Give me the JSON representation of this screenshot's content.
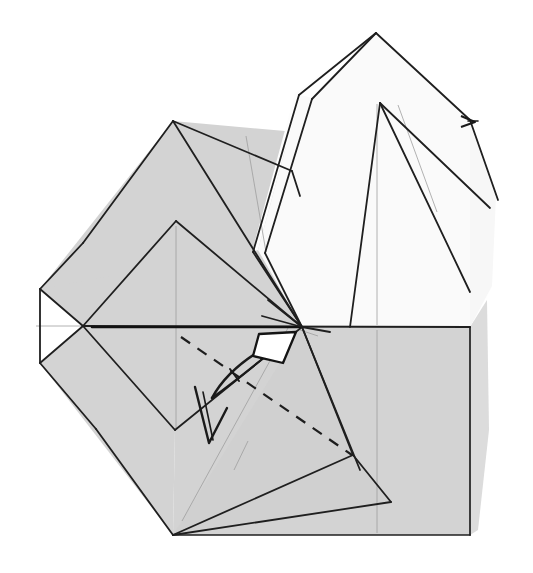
{
  "figure": {
    "kind": "origami-folding-diagram",
    "title": "",
    "caption": "",
    "step_number": "",
    "background_color": "#ffffff"
  },
  "palette": {
    "paper_front_gray": "#d2d2d2",
    "paper_front_gray_light": "#dcdcdc",
    "paper_back_white": "#f4f4f4",
    "paper_white": "#fbfbfb",
    "line_dark": "#1a1a1a",
    "line_mid": "#3a3a3a",
    "line_light": "#9a9a9a",
    "arrow_fill": "#ffffff",
    "arrow_stroke": "#141414"
  },
  "strokes": {
    "edge_width": 2.0,
    "fold_width": 1.5,
    "crease_width": 0.7,
    "dash_width": 2.2,
    "dash_pattern": "11 9"
  },
  "shapes": {
    "body_gray_left": {
      "name": "left-body-panel",
      "fill": "#d2d2d2",
      "points": "173,121 302,327 175,430 83,326 40,363 40,289 83,326"
    },
    "body_gray_upper_left": {
      "name": "upper-left-panel",
      "fill": "#d2d2d2",
      "points": "173,121 283,131 302,327 176,221 175,220"
    },
    "body_gray_lower": {
      "name": "lower-body-panel",
      "fill": "#d2d2d2",
      "points": "83,326 175,430 173,535 470,535 470,327 302,327"
    },
    "white_flap_upper": {
      "name": "upper-white-flap",
      "fill": "#fbfbfb",
      "points": "376,33 470,120 470,327 302,327 258,248 300,95 313,98"
    },
    "white_tail_right": {
      "name": "right-white-tail",
      "fill": "#fbfbfb",
      "points": "470,120 497,200 490,300 470,327"
    },
    "inner_flap": {
      "name": "inner-left-flap",
      "fill": "#d2d2d2",
      "points": "176,221 302,327 175,430 83,326"
    },
    "bottom_triangle": {
      "name": "bottom-right-triangle",
      "fill": "#d2d2d2",
      "points": "302,327 353,455 391,502 173,535"
    }
  },
  "lines": {
    "horizontal_center": {
      "name": "center-horizontal-fold",
      "x1": 40,
      "y1": 326,
      "x2": 470,
      "y2": 327
    },
    "right_vertical": {
      "name": "right-vertical-edge",
      "x1": 470,
      "y1": 327,
      "x2": 470,
      "y2": 535
    },
    "bottom_edge": {
      "name": "bottom-edge",
      "x1": 173,
      "y1": 535,
      "x2": 470,
      "y2": 535
    },
    "dashed_fold": {
      "name": "dashed-valley-fold",
      "x1": 186,
      "y1": 338,
      "x2": 352,
      "y2": 455
    }
  },
  "arrows": {
    "fold_arrow": {
      "name": "fold-arrow",
      "description": "hollow arrowhead pointing up-right",
      "tip_x": 297,
      "tip_y": 333,
      "head_points": "255,357 262,334 297,333 286,362",
      "shaft": "M 214,396 Q 232,376 262,352"
    },
    "repeat_mark": {
      "name": "repeat-v-mark",
      "description": "small v-shaped repeat symbol",
      "path": "M 196,389 L 209,443 L 225,410"
    },
    "edge_arrow_right": {
      "name": "right-edge-arrow",
      "description": "small arrowhead near right edge",
      "path": "M 463,117 L 474,122 L 463,126"
    }
  },
  "creases": [
    {
      "name": "crease-left-vertical",
      "d": "M 176,225 L 176,428"
    },
    {
      "name": "crease-center-vertical",
      "d": "M 376,103 L 376,325"
    },
    {
      "name": "crease-lower-vertical",
      "d": "M 376,330 L 376,533"
    },
    {
      "name": "crease-upper-left-diagonal",
      "d": "M 244,136 L 262,250"
    },
    {
      "name": "crease-upper-right-diagonal",
      "d": "M 398,103 L 430,200"
    },
    {
      "name": "crease-bottom-diagonal",
      "d": "M 181,521 L 282,330"
    }
  ]
}
